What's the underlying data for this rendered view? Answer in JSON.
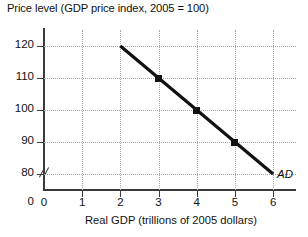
{
  "chart_data": {
    "type": "line",
    "title": "Price level (GDP price index, 2005 = 100)",
    "xlabel": "Real GDP (trillions of 2005 dollars)",
    "ylabel": "Price level (GDP price index, 2005 = 100)",
    "xlim": [
      0,
      6.6
    ],
    "ylim": [
      75,
      125
    ],
    "grid": true,
    "y_axis_break": true,
    "y_zero_label": "0",
    "xticks": [
      0,
      1,
      2,
      3,
      4,
      5,
      6
    ],
    "xtick_labels": [
      "0",
      "1",
      "2",
      "3",
      "4",
      "5",
      "6"
    ],
    "yticks": [
      80,
      90,
      100,
      110,
      120
    ],
    "ytick_labels": [
      "80",
      "90",
      "100",
      "110",
      "120"
    ],
    "legend_position": "inline-right-end",
    "series": [
      {
        "name": "AD",
        "label": "AD",
        "color": "#111111",
        "x": [
          2,
          3,
          4,
          5,
          6
        ],
        "values": [
          120,
          110,
          100,
          90,
          80
        ],
        "markers_at": [
          {
            "x": 3,
            "y": 110
          },
          {
            "x": 4,
            "y": 100
          },
          {
            "x": 5,
            "y": 90
          }
        ]
      }
    ]
  }
}
